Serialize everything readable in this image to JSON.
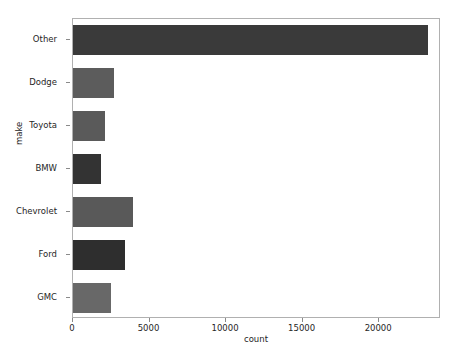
{
  "chart_data": {
    "type": "bar",
    "orientation": "horizontal",
    "title": "",
    "xlabel": "count",
    "ylabel": "make",
    "categories": [
      "Other",
      "Dodge",
      "Toyota",
      "BMW",
      "Chevrolet",
      "Ford",
      "GMC"
    ],
    "values": [
      23200,
      2680,
      2090,
      1830,
      3900,
      3400,
      2480
    ],
    "bar_colors": [
      "#3a3a3a",
      "#5c5c5c",
      "#5a5a5a",
      "#333333",
      "#595959",
      "#2e2e2e",
      "#686868"
    ],
    "xlim": [
      0,
      24040
    ],
    "x_ticks": [
      0,
      5000,
      10000,
      15000,
      20000
    ],
    "x_tick_labels": [
      "0",
      "5000",
      "10000",
      "15000",
      "20000"
    ],
    "grid": false,
    "legend": false,
    "axis_color": "#b0b0b0",
    "tick_color": "#8a8a8a",
    "text_color": "#262626",
    "background": "#ffffff"
  }
}
